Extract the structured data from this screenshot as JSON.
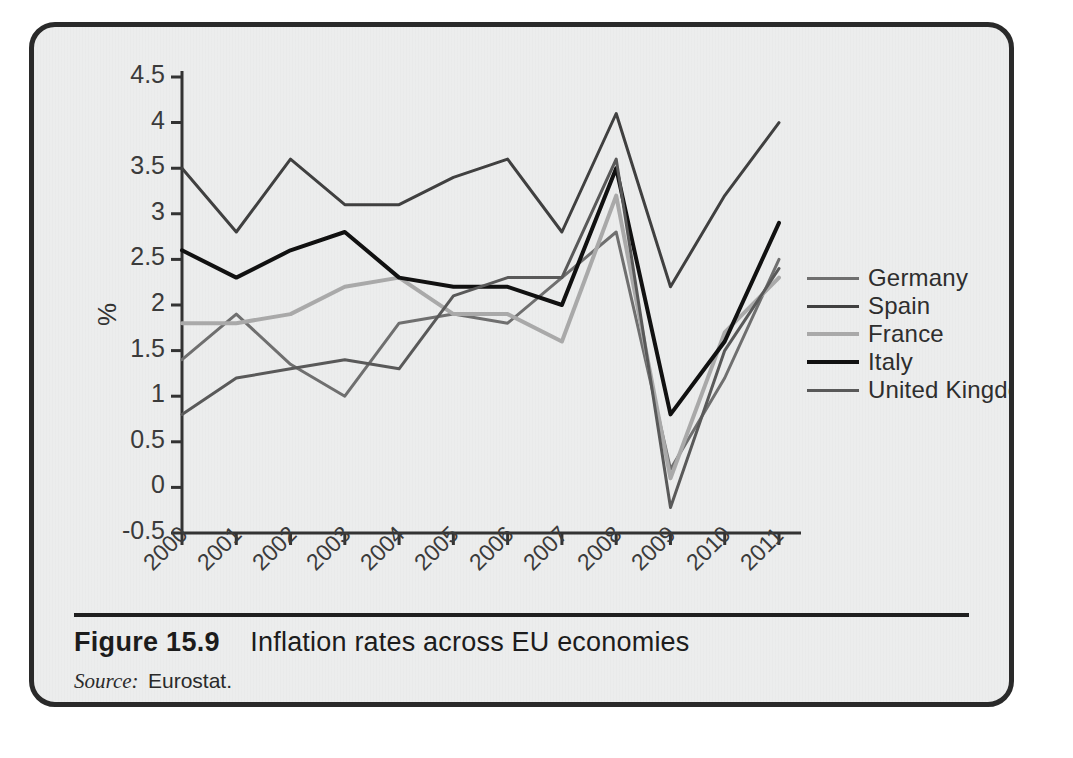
{
  "figure": {
    "number": "Figure 15.9",
    "title": "Inflation rates across EU economies",
    "source_label": "Source:",
    "source_value": "Eurostat."
  },
  "ghost": {
    "top_paragraph": "",
    "bottom_paragraph": "",
    "side_text": ""
  },
  "chart_data": {
    "type": "line",
    "title": "Inflation rates across EU economies",
    "xlabel": "",
    "ylabel": "%",
    "x": [
      2000,
      2001,
      2002,
      2003,
      2004,
      2005,
      2006,
      2007,
      2008,
      2009,
      2010,
      2011
    ],
    "categories": [
      "2000",
      "2001",
      "2002",
      "2003",
      "2004",
      "2005",
      "2006",
      "2007",
      "2008",
      "2009",
      "2010",
      "2011"
    ],
    "xlim": [
      2000,
      2011
    ],
    "ylim": [
      -0.5,
      4.5
    ],
    "yticks": [
      -0.5,
      0,
      0.5,
      1,
      1.5,
      2,
      2.5,
      3,
      3.5,
      4,
      4.5
    ],
    "ytick_labels": [
      "-0.5",
      "0",
      "0.5",
      "1",
      "1.5",
      "2",
      "2.5",
      "3",
      "3.5",
      "4",
      "4.5"
    ],
    "grid": false,
    "legend_position": "right",
    "series": [
      {
        "name": "Germany",
        "color": "#6f6f6f",
        "width": 3,
        "values": [
          1.4,
          1.9,
          1.35,
          1.0,
          1.8,
          1.9,
          1.8,
          2.3,
          2.8,
          0.2,
          1.2,
          2.5
        ]
      },
      {
        "name": "Spain",
        "color": "#404040",
        "width": 3,
        "values": [
          3.5,
          2.8,
          3.6,
          3.1,
          3.1,
          3.4,
          3.6,
          2.8,
          4.1,
          2.2,
          3.2,
          4.0
        ]
      },
      {
        "name": "France",
        "color": "#a9a9a9",
        "width": 4,
        "values": [
          1.8,
          1.8,
          1.9,
          2.2,
          2.3,
          1.9,
          1.9,
          1.6,
          3.2,
          0.1,
          1.7,
          2.3
        ]
      },
      {
        "name": "Italy",
        "color": "#111111",
        "width": 4,
        "values": [
          2.6,
          2.3,
          2.6,
          2.8,
          2.3,
          2.2,
          2.2,
          2.0,
          3.5,
          0.8,
          1.6,
          2.9
        ]
      },
      {
        "name": "United Kingdom",
        "color": "#595959",
        "width": 3,
        "values": [
          0.8,
          1.2,
          1.3,
          1.4,
          1.3,
          2.1,
          2.3,
          2.3,
          3.6,
          -0.22,
          1.5,
          2.4
        ]
      }
    ]
  }
}
